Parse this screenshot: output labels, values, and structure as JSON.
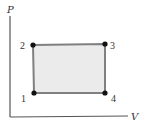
{
  "diagram": {
    "type": "pv-cycle",
    "axes": {
      "y_label": "P",
      "x_label": "V"
    },
    "points": [
      {
        "id": "1",
        "label": "1",
        "x": 34,
        "y": 93
      },
      {
        "id": "2",
        "label": "2",
        "x": 33,
        "y": 45
      },
      {
        "id": "3",
        "label": "3",
        "x": 105,
        "y": 44
      },
      {
        "id": "4",
        "label": "4",
        "x": 105,
        "y": 93
      }
    ],
    "colors": {
      "fill": "#ebebeb",
      "edge": "#808080",
      "axis": "#555555",
      "point": "#111111"
    }
  }
}
